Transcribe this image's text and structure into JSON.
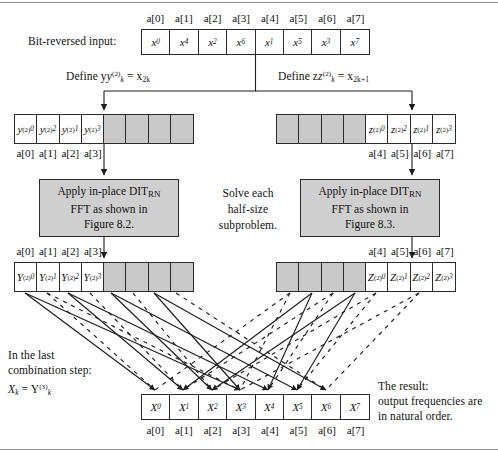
{
  "figure": {
    "colors": {
      "shade": "#c9c9c9",
      "box": "#cfcfcf",
      "ink": "#2b2b2b",
      "rule": "#8e8e8e"
    }
  },
  "labels": {
    "bit_reversed_input": "Bit-reversed input:",
    "define_y": "Define y",
    "define_y_sup": "(2)",
    "define_y_sub": "k",
    "define_y_rhs": "= x",
    "define_y_rhs_sub": "2k",
    "define_z": "Define z",
    "define_z_sup": "(2)",
    "define_z_sub": "k",
    "define_z_rhs": "= x",
    "define_z_rhs_sub": "2k+1",
    "solve_each": [
      "Solve each",
      "half-size",
      "subproblem."
    ],
    "last_step": [
      "In the last",
      "combination step:"
    ],
    "last_step_eq_lhs": "X",
    "last_step_eq_lhs_sub": "k",
    "last_step_eq_mid": "= Y",
    "last_step_eq_rhs_sup": "(3)",
    "last_step_eq_rhs_sub": "k",
    "result": [
      "The result:",
      "output frequencies are",
      "in natural order."
    ]
  },
  "index_labels": [
    "a[0]",
    "a[1]",
    "a[2]",
    "a[3]",
    "a[4]",
    "a[5]",
    "a[6]",
    "a[7]"
  ],
  "index_labels_left": [
    "a[0]",
    "a[1]",
    "a[2]",
    "a[3]"
  ],
  "index_labels_right": [
    "a[4]",
    "a[5]",
    "a[6]",
    "a[7]"
  ],
  "arrays": {
    "input": {
      "name": "bit-reversed-input-array",
      "cells": [
        {
          "base": "x",
          "sub": "0",
          "shaded": false
        },
        {
          "base": "x",
          "sub": "4",
          "shaded": false
        },
        {
          "base": "x",
          "sub": "2",
          "shaded": false
        },
        {
          "base": "x",
          "sub": "6",
          "shaded": false
        },
        {
          "base": "x",
          "sub": "1",
          "shaded": false
        },
        {
          "base": "x",
          "sub": "5",
          "shaded": false
        },
        {
          "base": "x",
          "sub": "3",
          "shaded": false
        },
        {
          "base": "x",
          "sub": "7",
          "shaded": false
        }
      ]
    },
    "y_input": {
      "name": "y-subproblem-array",
      "cells": [
        {
          "base": "y",
          "sub": "0",
          "sup": "(2)",
          "shaded": false
        },
        {
          "base": "y",
          "sub": "2",
          "sup": "(2)",
          "shaded": false
        },
        {
          "base": "y",
          "sub": "1",
          "sup": "(2)",
          "shaded": false
        },
        {
          "base": "y",
          "sub": "3",
          "sup": "(2)",
          "shaded": false
        },
        {
          "base": "",
          "sub": "",
          "sup": "",
          "shaded": true
        },
        {
          "base": "",
          "sub": "",
          "sup": "",
          "shaded": true
        },
        {
          "base": "",
          "sub": "",
          "sup": "",
          "shaded": true
        },
        {
          "base": "",
          "sub": "",
          "sup": "",
          "shaded": true
        }
      ]
    },
    "z_input": {
      "name": "z-subproblem-array",
      "cells": [
        {
          "base": "",
          "sub": "",
          "sup": "",
          "shaded": true
        },
        {
          "base": "",
          "sub": "",
          "sup": "",
          "shaded": true
        },
        {
          "base": "",
          "sub": "",
          "sup": "",
          "shaded": true
        },
        {
          "base": "",
          "sub": "",
          "sup": "",
          "shaded": true
        },
        {
          "base": "z",
          "sub": "0",
          "sup": "(2)",
          "shaded": false
        },
        {
          "base": "z",
          "sub": "2",
          "sup": "(2)",
          "shaded": false
        },
        {
          "base": "z",
          "sub": "1",
          "sup": "(2)",
          "shaded": false
        },
        {
          "base": "z",
          "sub": "3",
          "sup": "(2)",
          "shaded": false
        }
      ]
    },
    "Y_output": {
      "name": "Y-result-array",
      "cells": [
        {
          "base": "Y",
          "sub": "0",
          "sup": "(2)",
          "shaded": false
        },
        {
          "base": "Y",
          "sub": "1",
          "sup": "(2)",
          "shaded": false
        },
        {
          "base": "Y",
          "sub": "2",
          "sup": "(2)",
          "shaded": false
        },
        {
          "base": "Y",
          "sub": "3",
          "sup": "(2)",
          "shaded": false
        },
        {
          "base": "",
          "sub": "",
          "sup": "",
          "shaded": true
        },
        {
          "base": "",
          "sub": "",
          "sup": "",
          "shaded": true
        },
        {
          "base": "",
          "sub": "",
          "sup": "",
          "shaded": true
        },
        {
          "base": "",
          "sub": "",
          "sup": "",
          "shaded": true
        }
      ]
    },
    "Z_output": {
      "name": "Z-result-array",
      "cells": [
        {
          "base": "",
          "sub": "",
          "sup": "",
          "shaded": true
        },
        {
          "base": "",
          "sub": "",
          "sup": "",
          "shaded": true
        },
        {
          "base": "",
          "sub": "",
          "sup": "",
          "shaded": true
        },
        {
          "base": "",
          "sub": "",
          "sup": "",
          "shaded": true
        },
        {
          "base": "Z",
          "sub": "0",
          "sup": "(2)",
          "shaded": false
        },
        {
          "base": "Z",
          "sub": "1",
          "sup": "(2)",
          "shaded": false
        },
        {
          "base": "Z",
          "sub": "2",
          "sup": "(2)",
          "shaded": false
        },
        {
          "base": "Z",
          "sub": "3",
          "sup": "(2)",
          "shaded": false
        }
      ]
    },
    "final": {
      "name": "final-output-array",
      "cells": [
        {
          "base": "X",
          "sub": "0",
          "shaded": false
        },
        {
          "base": "X",
          "sub": "1",
          "shaded": false
        },
        {
          "base": "X",
          "sub": "2",
          "shaded": false
        },
        {
          "base": "X",
          "sub": "3",
          "shaded": false
        },
        {
          "base": "X",
          "sub": "4",
          "shaded": false
        },
        {
          "base": "X",
          "sub": "5",
          "shaded": false
        },
        {
          "base": "X",
          "sub": "6",
          "shaded": false
        },
        {
          "base": "X",
          "sub": "7",
          "shaded": false
        }
      ]
    }
  },
  "process_boxes": [
    {
      "name": "fft-box-left",
      "lines": [
        "Apply in-place DIT",
        "FFT as shown in",
        "Figure 8.2."
      ],
      "subscript": "RN",
      "figure_ref": "Figure 8.2."
    },
    {
      "name": "fft-box-right",
      "lines": [
        "Apply in-place DIT",
        "FFT as shown in",
        "Figure 8.3."
      ],
      "subscript": "RN",
      "figure_ref": "Figure 8.3."
    }
  ]
}
